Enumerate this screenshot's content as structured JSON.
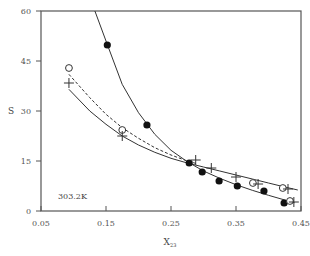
{
  "chart_data": {
    "type": "scatter",
    "title": "",
    "xlabel": "X",
    "xlabel_sub": "23",
    "ylabel": "S",
    "xlim": [
      0.05,
      0.45
    ],
    "ylim": [
      0,
      60
    ],
    "xticks": [
      0.05,
      0.15,
      0.25,
      0.35,
      0.45
    ],
    "xtick_labels": [
      "0.05",
      "0.15",
      "0.25",
      "0.35",
      "0.45"
    ],
    "yticks": [
      0,
      15,
      30,
      45,
      60
    ],
    "ytick_labels": [
      "0",
      "15",
      "30",
      "45",
      "60"
    ],
    "grid": false,
    "legend": null,
    "annotation": "303.2K",
    "series": [
      {
        "name": "filled-circles",
        "marker": "filled-circle",
        "x": [
          0.152,
          0.213,
          0.278,
          0.298,
          0.324,
          0.352,
          0.393,
          0.424
        ],
        "y": [
          49.8,
          25.8,
          14.4,
          11.7,
          9.0,
          7.5,
          6.0,
          2.4
        ]
      },
      {
        "name": "open-circles",
        "marker": "open-circle",
        "x": [
          0.093,
          0.175,
          0.376,
          0.422,
          0.433
        ],
        "y": [
          42.9,
          24.3,
          8.4,
          6.9,
          3.0
        ]
      },
      {
        "name": "plus",
        "marker": "plus",
        "x": [
          0.093,
          0.175,
          0.288,
          0.312,
          0.35,
          0.384,
          0.43,
          0.439
        ],
        "y": [
          38.4,
          22.5,
          15.3,
          12.9,
          10.2,
          8.1,
          6.6,
          2.7
        ]
      }
    ],
    "curves": [
      {
        "name": "fit-filled",
        "style": "solid",
        "x": [
          0.133,
          0.15,
          0.175,
          0.2,
          0.225,
          0.25,
          0.275,
          0.3,
          0.325,
          0.35,
          0.375,
          0.4,
          0.425,
          0.44
        ],
        "y": [
          60,
          51,
          38,
          29.5,
          23,
          18.2,
          14.8,
          12,
          9.8,
          7.9,
          6.2,
          4.7,
          3.3,
          2.5
        ]
      },
      {
        "name": "fit-open-circles",
        "style": "dashed",
        "x": [
          0.093,
          0.125,
          0.15,
          0.175,
          0.2,
          0.225,
          0.25,
          0.275,
          0.29
        ],
        "y": [
          41,
          34,
          29,
          25,
          21.8,
          19,
          16.8,
          15,
          14.2
        ]
      },
      {
        "name": "fit-plus",
        "style": "solid",
        "x": [
          0.093,
          0.125,
          0.15,
          0.175,
          0.2,
          0.225,
          0.25,
          0.275,
          0.3,
          0.325,
          0.35,
          0.375,
          0.4,
          0.425,
          0.445
        ],
        "y": [
          36.5,
          30,
          26,
          22.5,
          19.8,
          17.6,
          15.8,
          14.4,
          13.2,
          12,
          10.8,
          9.6,
          8.4,
          7.2,
          6.3
        ]
      }
    ]
  }
}
